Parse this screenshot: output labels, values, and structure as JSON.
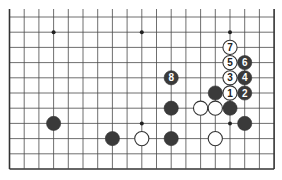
{
  "diagram": {
    "type": "go-board-fragment",
    "board": {
      "columns": 19,
      "rows_shown": 11,
      "open_edge": "top",
      "origin_x": 9.5,
      "origin_y": 17,
      "col_spacing": 14.7,
      "row_spacing": 15.2,
      "line_color": "#4a4a4a",
      "edge_color": "#333333"
    },
    "hoshi": [
      {
        "col": 3,
        "row": 1
      },
      {
        "col": 9,
        "row": 1
      },
      {
        "col": 15,
        "row": 1
      },
      {
        "col": 9,
        "row": 7
      },
      {
        "col": 15,
        "row": 7
      }
    ],
    "stones": [
      {
        "color": "white",
        "col": 15,
        "row": 5,
        "label": "1"
      },
      {
        "color": "black",
        "col": 16,
        "row": 5,
        "label": "2"
      },
      {
        "color": "white",
        "col": 15,
        "row": 4,
        "label": "3"
      },
      {
        "color": "black",
        "col": 16,
        "row": 4,
        "label": "4"
      },
      {
        "color": "white",
        "col": 15,
        "row": 3,
        "label": "5"
      },
      {
        "color": "black",
        "col": 16,
        "row": 3,
        "label": "6"
      },
      {
        "color": "white",
        "col": 15,
        "row": 2,
        "label": "7"
      },
      {
        "color": "black",
        "col": 11,
        "row": 4,
        "label": "8"
      },
      {
        "color": "black",
        "col": 14,
        "row": 5,
        "label": ""
      },
      {
        "color": "black",
        "col": 11,
        "row": 6,
        "label": ""
      },
      {
        "color": "white",
        "col": 13,
        "row": 6,
        "label": ""
      },
      {
        "color": "white",
        "col": 14,
        "row": 6,
        "label": ""
      },
      {
        "color": "black",
        "col": 15,
        "row": 6,
        "label": ""
      },
      {
        "color": "black",
        "col": 16,
        "row": 7,
        "label": ""
      },
      {
        "color": "black",
        "col": 3,
        "row": 7,
        "label": ""
      },
      {
        "color": "black",
        "col": 7,
        "row": 8,
        "label": ""
      },
      {
        "color": "white",
        "col": 9,
        "row": 8,
        "label": ""
      },
      {
        "color": "black",
        "col": 11,
        "row": 8,
        "label": ""
      },
      {
        "color": "white",
        "col": 14,
        "row": 8,
        "label": ""
      }
    ],
    "colors": {
      "black_stone": "#3a3a3a",
      "white_stone": "#ffffff",
      "stone_outline": "#333333",
      "label_on_black": "#ffffff",
      "label_on_white": "#222222"
    }
  }
}
